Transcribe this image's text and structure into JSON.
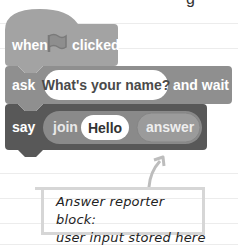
{
  "background": {
    "ruled_line_color": "#ececec",
    "ruled_lines_y": [
      23,
      48,
      98,
      123,
      148,
      173,
      198,
      223
    ]
  },
  "top_cutoff_glyph": "g",
  "script": {
    "hat_block": {
      "color": "#a3a3a3",
      "label_before": "when",
      "icon": "green-flag-icon",
      "label_after": "clicked"
    },
    "ask_block": {
      "color": "#8f8f8f",
      "label": "ask",
      "input_value": "What's your name?",
      "label_after": "and wait"
    },
    "say_block": {
      "color": "#585858",
      "label": "say",
      "join_reporter": {
        "color": "#8a8a8a",
        "label": "join",
        "first_input": "Hello",
        "second_input": {
          "color": "#9b9b9b",
          "label": "answer"
        }
      }
    }
  },
  "annotation": {
    "line1": "Answer reporter block:",
    "line2": "user input stored here",
    "border_color": "#d6d6d6",
    "arrow_color": "#bdbdbd"
  }
}
